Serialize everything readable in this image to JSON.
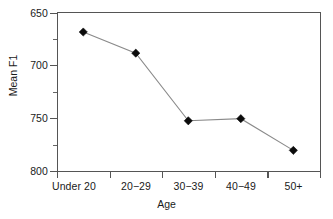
{
  "chart_data": {
    "type": "line",
    "title": "",
    "xlabel": "Age",
    "ylabel": "Mean F1",
    "categories": [
      "Under 20",
      "20−29",
      "30−39",
      "40−49",
      "50+"
    ],
    "values": [
      668,
      688,
      752,
      750,
      780
    ],
    "series": [
      {
        "name": "Mean F1",
        "values": [
          668,
          688,
          752,
          750,
          780
        ],
        "marker": "diamond",
        "marker_color": "#0b0b0b",
        "line_color": "#8a8a8a"
      }
    ],
    "ylim": [
      650,
      800
    ],
    "y_inverted": true,
    "y_ticks": [
      650,
      700,
      750,
      800
    ],
    "y_tick_labels": [
      "650",
      "700",
      "750",
      "800"
    ],
    "y_minor_ticks": [
      675,
      725,
      775
    ],
    "grid": false,
    "legend": null,
    "legend_position": "none",
    "background_color": "#ffffff",
    "axis_color": "#555555"
  },
  "axes": {
    "y_title": "Mean F1",
    "x_title": "Age",
    "y_tick_labels": [
      "650",
      "700",
      "750",
      "800"
    ],
    "x_tick_labels": [
      "Under 20",
      "20−29",
      "30−39",
      "40−49",
      "50+"
    ]
  },
  "caption": {
    "clipped_text": ""
  }
}
